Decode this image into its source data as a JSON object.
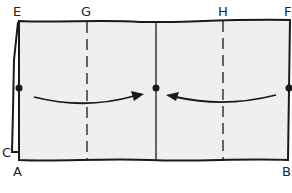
{
  "diagram": {
    "title": "",
    "labels": {
      "E": "E",
      "G": "G",
      "H": "H",
      "F": "F",
      "C": "C",
      "A": "A",
      "B": "B"
    },
    "fold_lines": [
      {
        "name": "G",
        "style": "dashed"
      },
      {
        "name": "center",
        "style": "solid"
      },
      {
        "name": "H",
        "style": "dashed"
      }
    ],
    "arrows": [
      {
        "direction": "left-to-center"
      },
      {
        "direction": "right-to-center"
      }
    ],
    "colors": {
      "paper_fill": "#f0f0f0",
      "stroke": "#1a1a1a"
    }
  }
}
